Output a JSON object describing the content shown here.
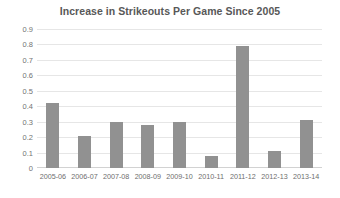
{
  "chart_data": {
    "type": "bar",
    "title": "Increase in Strikeouts Per Game Since 2005",
    "xlabel": "",
    "ylabel": "",
    "categories": [
      "2005-06",
      "2006-07",
      "2007-08",
      "2008-09",
      "2009-10",
      "2010-11",
      "2011-12",
      "2012-13",
      "2013-14"
    ],
    "values": [
      0.42,
      0.21,
      0.3,
      0.28,
      0.3,
      0.08,
      0.79,
      0.11,
      0.31
    ],
    "series": [
      {
        "name": "Increase in Strikeouts Per Game",
        "values": [
          0.42,
          0.21,
          0.3,
          0.28,
          0.3,
          0.08,
          0.79,
          0.11,
          0.31
        ]
      }
    ],
    "ylim": [
      0,
      0.9
    ],
    "ytick_labels": [
      "0.9",
      "0.8",
      "0.7",
      "0.6",
      "0.5",
      "0.4",
      "0.3",
      "0.2",
      "0.1",
      "0"
    ],
    "ytick_values": [
      0.9,
      0.8,
      0.7,
      0.6,
      0.5,
      0.4,
      0.3,
      0.2,
      0.1,
      0
    ],
    "grid": true,
    "grid_axis": "y",
    "legend": false,
    "legend_position": "none",
    "bar_color": "#919191",
    "gridline_color": "#e6e6e6",
    "axis_line_color": "#d2d2d2",
    "title_color": "#585858",
    "tick_label_color": "#737373",
    "background_color": "#ffffff"
  }
}
